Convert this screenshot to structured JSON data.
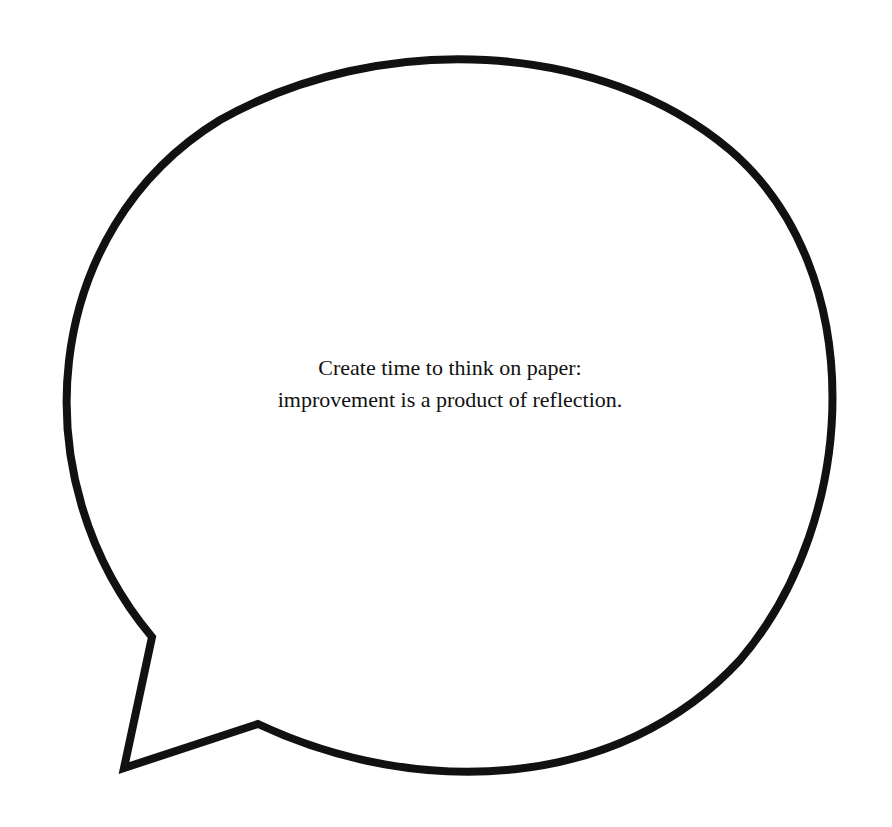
{
  "speech_bubble": {
    "text_lines": [
      "Create time to think on paper:",
      "improvement is a product of reflection."
    ],
    "stroke_color": "#111111",
    "fill_color": "#ffffff",
    "tail_direction": "bottom-left"
  }
}
